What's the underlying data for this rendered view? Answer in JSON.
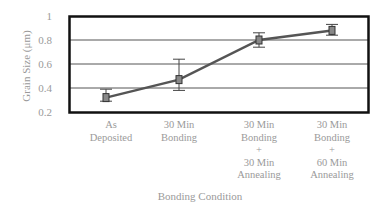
{
  "chart_data": {
    "type": "line",
    "title": "",
    "xlabel": "Bonding Condition",
    "ylabel": "Grain Size (μm)",
    "ylim": [
      0.2,
      1.0
    ],
    "yticks": [
      "0.2",
      "0.4",
      "0.6",
      "0.8",
      "1"
    ],
    "grid": true,
    "legend": null,
    "categories": [
      [
        "As",
        "Deposited"
      ],
      [
        "30 Min",
        "Bonding"
      ],
      [
        "30 Min",
        "Bonding",
        "+",
        "30 Min",
        "Annealing"
      ],
      [
        "30 Min",
        "Bonding",
        "+",
        "60 Min",
        "Annealing"
      ]
    ],
    "series": [
      {
        "name": "Grain Size",
        "values": [
          0.32,
          0.47,
          0.8,
          0.88
        ],
        "error_low": [
          0.29,
          0.38,
          0.74,
          0.84
        ],
        "error_high": [
          0.39,
          0.64,
          0.86,
          0.93
        ],
        "color": "#555555"
      }
    ]
  }
}
